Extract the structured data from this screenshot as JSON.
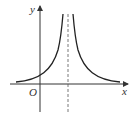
{
  "diagram": {
    "type": "function-graph",
    "labels": {
      "x_axis": "x",
      "y_axis": "y",
      "origin": "O"
    },
    "colors": {
      "curve": "#222222",
      "axis": "#333333",
      "asymptote": "#555555"
    }
  }
}
